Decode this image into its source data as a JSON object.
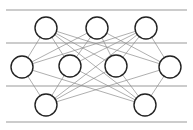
{
  "figure": {
    "width": 193,
    "height": 130,
    "background_color": "#ffffff"
  },
  "style": {
    "node_fill": "#ffffff",
    "node_stroke": "#222222",
    "node_stroke_width": 1.4,
    "node_radius": 11,
    "edge_color": "#8d8d8d",
    "edge_width": 0.7,
    "rule_color": "#9a9a9a",
    "rule_width": 1.1
  },
  "rules": [
    {
      "name": "rule-top",
      "y": 10,
      "x1": 6,
      "x2": 187
    },
    {
      "name": "rule-upper-mid",
      "y": 43,
      "x1": 6,
      "x2": 187
    },
    {
      "name": "rule-lower-mid",
      "y": 86,
      "x1": 6,
      "x2": 187
    },
    {
      "name": "rule-bottom",
      "y": 122,
      "x1": 6,
      "x2": 187
    }
  ],
  "chart_data": {
    "type": "scatter",
    "title": "",
    "xlabel": "",
    "ylabel": "",
    "grid": true,
    "legend": "none",
    "layers": [
      {
        "name": "top-layer",
        "count": 3
      },
      {
        "name": "middle-layer",
        "count": 4
      },
      {
        "name": "bottom-layer",
        "count": 2
      }
    ],
    "nodes": [
      {
        "id": "t1",
        "layer": "top-layer",
        "label": "",
        "x": 46,
        "y": 28,
        "r": 11
      },
      {
        "id": "t2",
        "layer": "top-layer",
        "label": "",
        "x": 97,
        "y": 28,
        "r": 11
      },
      {
        "id": "t3",
        "layer": "top-layer",
        "label": "",
        "x": 146,
        "y": 28,
        "r": 11
      },
      {
        "id": "m1",
        "layer": "middle-layer",
        "label": "",
        "x": 22,
        "y": 67,
        "r": 11
      },
      {
        "id": "m2",
        "layer": "middle-layer",
        "label": "",
        "x": 70,
        "y": 66,
        "r": 11
      },
      {
        "id": "m3",
        "layer": "middle-layer",
        "label": "",
        "x": 116,
        "y": 66,
        "r": 11
      },
      {
        "id": "m4",
        "layer": "middle-layer",
        "label": "",
        "x": 170,
        "y": 67,
        "r": 11
      },
      {
        "id": "b1",
        "layer": "bottom-layer",
        "label": "",
        "x": 46,
        "y": 105,
        "r": 11
      },
      {
        "id": "b2",
        "layer": "bottom-layer",
        "label": "",
        "x": 145,
        "y": 105,
        "r": 11
      }
    ],
    "edges": [
      {
        "from": "t1",
        "to": "m1"
      },
      {
        "from": "t1",
        "to": "m2"
      },
      {
        "from": "t1",
        "to": "m3"
      },
      {
        "from": "t1",
        "to": "m4"
      },
      {
        "from": "t2",
        "to": "m1"
      },
      {
        "from": "t2",
        "to": "m2"
      },
      {
        "from": "t2",
        "to": "m3"
      },
      {
        "from": "t2",
        "to": "m4"
      },
      {
        "from": "t3",
        "to": "m1"
      },
      {
        "from": "t3",
        "to": "m2"
      },
      {
        "from": "t3",
        "to": "m3"
      },
      {
        "from": "t3",
        "to": "m4"
      },
      {
        "from": "b1",
        "to": "m1"
      },
      {
        "from": "b1",
        "to": "m2"
      },
      {
        "from": "b1",
        "to": "m3"
      },
      {
        "from": "b1",
        "to": "m4"
      },
      {
        "from": "b2",
        "to": "m1"
      },
      {
        "from": "b2",
        "to": "m2"
      },
      {
        "from": "b2",
        "to": "m3"
      },
      {
        "from": "b2",
        "to": "m4"
      },
      {
        "from": "t1",
        "to": "b2"
      },
      {
        "from": "t3",
        "to": "b1"
      }
    ]
  }
}
